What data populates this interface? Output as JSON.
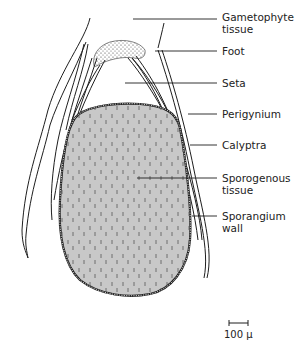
{
  "figure": {
    "colors": {
      "sporogenous_fill": "#c8c8c8",
      "outline": "#1e1e1e",
      "background": "#ffffff"
    }
  },
  "labels": [
    {
      "id": "gametophyte-tissue",
      "lines": [
        "Gametophyte",
        "tissue"
      ]
    },
    {
      "id": "foot",
      "lines": [
        "Foot"
      ]
    },
    {
      "id": "seta",
      "lines": [
        "Seta"
      ]
    },
    {
      "id": "perigynium",
      "lines": [
        "Perigynium"
      ]
    },
    {
      "id": "calyptra",
      "lines": [
        "Calyptra"
      ]
    },
    {
      "id": "sporogenous-tissue",
      "lines": [
        "Sporogenous",
        "tissue"
      ]
    },
    {
      "id": "sporangium-wall",
      "lines": [
        "Sporangium",
        "wall"
      ]
    }
  ],
  "scale_bar": {
    "label": "100 µ"
  }
}
